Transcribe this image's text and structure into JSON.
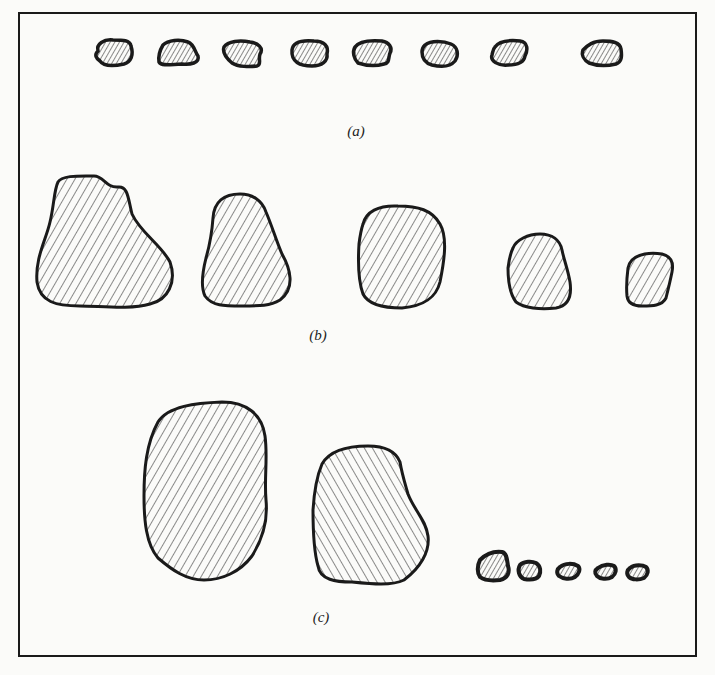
{
  "figure": {
    "panels": [
      {
        "id": "a",
        "label": "(a)",
        "description": "Eight equal-sized small particles in a row"
      },
      {
        "id": "b",
        "label": "(b)",
        "description": "Five particles decreasing in size from left to right"
      },
      {
        "id": "c",
        "label": "(c)",
        "description": "Two large particles and five very small particles"
      }
    ],
    "colors": {
      "ink": "#1a1a1a",
      "paper": "#fbfbf9"
    }
  }
}
